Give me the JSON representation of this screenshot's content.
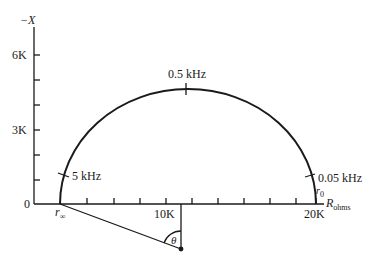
{
  "diagram": {
    "type": "impedance locus (semicircle)",
    "y_axis_label": "−X",
    "x_axis_label_main": "R",
    "x_axis_label_sub": "ohms",
    "y_ticks": [
      "0",
      "3K",
      "6K"
    ],
    "x_ticks": [
      "10K",
      "20K"
    ],
    "freq_labels": [
      "5 kHz",
      "0.5 kHz",
      "0.05 kHz"
    ],
    "r_inf_main": "r",
    "r_inf_sub": "∞",
    "r0_main": "r",
    "r0_sub": "0",
    "angle_label": "θ",
    "colors": {
      "stroke": "#1a1a1a",
      "background": "#ffffff"
    }
  }
}
